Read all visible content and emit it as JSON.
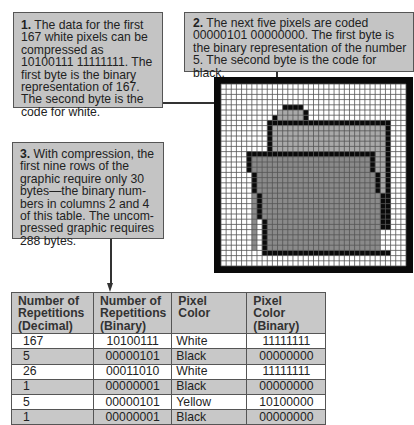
{
  "callouts": [
    {
      "number": "1.",
      "text": " The data for the first 167 white pixels can be compressed as 10100111 11111111. The first byte is the binary representation of 167. The second byte is the code for white."
    },
    {
      "number": "2.",
      "text": " The next five pixels are coded 00000101 00000000. The first byte is the binary representation of the number 5. The second byte is the code for black."
    },
    {
      "number": "3.",
      "text": " With compression, the first nine rows of the graphic require only 30 bytes—the binary num­bers in columns 2 and 4 of this table. The uncom­pressed graphic requires 288 bytes."
    }
  ],
  "graphic": {
    "description": "32x32 pixel grid showing a folder icon",
    "colors": {
      "white": "#ffffff",
      "black": "#0a0a0a",
      "yellow_back": "#a9a9a9",
      "yellow_front": "#8a8a8a",
      "gridline": "#555555"
    }
  },
  "table": {
    "headers": [
      "Number of Repetitions (Decimal)",
      "Number of Repetitions (Binary)",
      "Pixel Color",
      "Pixel Color (Binary)"
    ],
    "header_lines": [
      [
        "Number of",
        "Repetitions",
        "(Decimal)"
      ],
      [
        "Number of",
        "Repetitions",
        "(Binary)"
      ],
      [
        "Pixel",
        "Color",
        ""
      ],
      [
        "Pixel",
        "Color",
        "(Binary)"
      ]
    ],
    "rows": [
      [
        "167",
        "10100111",
        "White",
        "11111111"
      ],
      [
        "5",
        "00000101",
        "Black",
        "00000000"
      ],
      [
        "26",
        "00011010",
        "White",
        "11111111"
      ],
      [
        "1",
        "00000001",
        "Black",
        "00000000"
      ],
      [
        "5",
        "00000101",
        "Yellow",
        "10100000"
      ],
      [
        "1",
        "00000001",
        "Black",
        "00000000"
      ]
    ]
  }
}
